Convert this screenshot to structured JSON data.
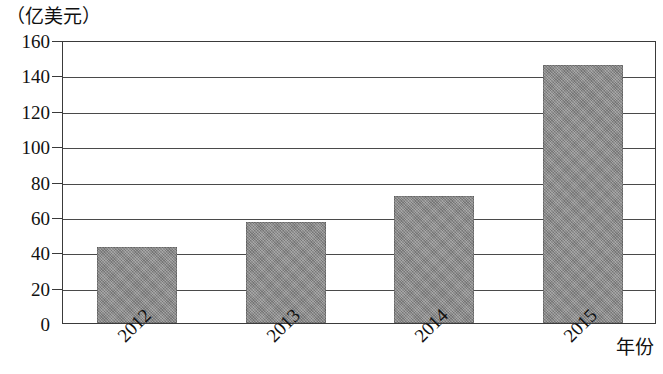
{
  "chart_data": {
    "type": "bar",
    "title": "",
    "subtitle": "",
    "xlabel": "年份",
    "ylabel": "（亿美元）",
    "categories": [
      "2012",
      "2013",
      "2014",
      "2015"
    ],
    "values": [
      43,
      57,
      72,
      146
    ],
    "series": [
      {
        "name": "",
        "values": [
          43,
          57,
          72,
          146
        ]
      }
    ],
    "ylim": [
      0,
      160
    ],
    "ytick_labels": [
      "0",
      "20",
      "40",
      "60",
      "80",
      "100",
      "120",
      "140",
      "160"
    ],
    "ytick_values": [
      0,
      20,
      40,
      60,
      80,
      100,
      120,
      140,
      160
    ],
    "ytick_step": 20,
    "grid": true,
    "grid_axis": "y",
    "legend": false,
    "legend_position": "none",
    "bar_color": "#8d8d8d",
    "bar_texture": "noisy-gray",
    "frame_color": "#3a3a3a",
    "xtick_rotation_deg": -45,
    "annotations": []
  },
  "axes": {
    "unit_label": "（亿美元）",
    "x_axis_title": "年份"
  }
}
